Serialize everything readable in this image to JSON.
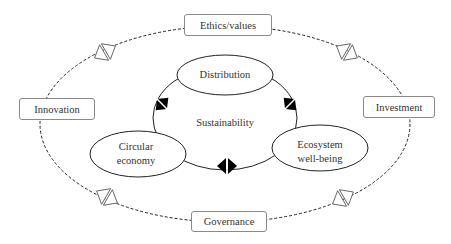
{
  "diagram": {
    "center_label": "Sustainability",
    "inner_nodes": [
      {
        "id": "distribution",
        "label": "Distribution"
      },
      {
        "id": "circular",
        "label_line1": "Circular",
        "label_line2": "economy"
      },
      {
        "id": "ecosystem",
        "label_line1": "Ecosystem",
        "label_line2": "well-being"
      }
    ],
    "outer_nodes": [
      {
        "id": "ethics",
        "label": "Ethics/values"
      },
      {
        "id": "innovation",
        "label": "Innovation"
      },
      {
        "id": "investment",
        "label": "Investment"
      },
      {
        "id": "governance",
        "label": "Governance"
      }
    ],
    "colors": {
      "line": "#222222",
      "box_border": "#8a8a8a",
      "marker_fill_inner": "#000000",
      "marker_fill_outer": "#ffffff"
    }
  }
}
